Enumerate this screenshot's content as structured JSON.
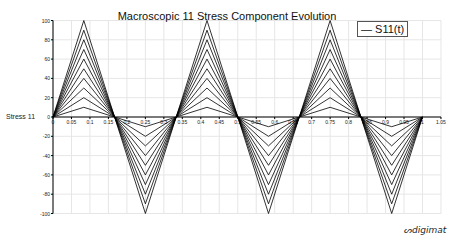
{
  "chart_data": {
    "type": "line",
    "title": "Macroscopic 11 Stress Component Evolution",
    "xlabel": "",
    "ylabel": "Stress 11",
    "xlim": [
      0,
      1.05
    ],
    "ylim": [
      -100,
      100
    ],
    "x_ticks": [
      "0",
      "0.05",
      "0.1",
      "0.15",
      "0.2",
      "0.25",
      "0.3",
      "0.35",
      "0.4",
      "0.45",
      "0.5",
      "0.55",
      "0.6",
      "0.65",
      "0.7",
      "0.75",
      "0.8",
      "0.85",
      "0.9",
      "0.95",
      "1",
      "1.05"
    ],
    "y_ticks": [
      "100",
      "80",
      "60",
      "40",
      "20",
      "0",
      "-20",
      "-40",
      "-60",
      "-80",
      "-100"
    ],
    "grid": true,
    "legend": [
      "S11(t)"
    ],
    "legend_position": "top-right",
    "x": [
      0,
      0.0833,
      0.1667,
      0.25,
      0.3333,
      0.4167,
      0.5,
      0.5833,
      0.6667,
      0.75,
      0.8333,
      0.9167,
      1.0
    ],
    "series": [
      {
        "name": "S11(t) amp 10",
        "values": [
          0,
          10,
          0,
          -10,
          0,
          10,
          0,
          -10,
          0,
          10,
          0,
          -10,
          0
        ]
      },
      {
        "name": "S11(t) amp 20",
        "values": [
          0,
          20,
          0,
          -20,
          0,
          20,
          0,
          -20,
          0,
          20,
          0,
          -20,
          0
        ]
      },
      {
        "name": "S11(t) amp 30",
        "values": [
          0,
          30,
          0,
          -30,
          0,
          30,
          0,
          -30,
          0,
          30,
          0,
          -30,
          0
        ]
      },
      {
        "name": "S11(t) amp 40",
        "values": [
          0,
          40,
          0,
          -40,
          0,
          40,
          0,
          -40,
          0,
          40,
          0,
          -40,
          0
        ]
      },
      {
        "name": "S11(t) amp 50",
        "values": [
          0,
          50,
          0,
          -50,
          0,
          50,
          0,
          -50,
          0,
          50,
          0,
          -50,
          0
        ]
      },
      {
        "name": "S11(t) amp 60",
        "values": [
          0,
          60,
          0,
          -60,
          0,
          60,
          0,
          -60,
          0,
          60,
          0,
          -60,
          0
        ]
      },
      {
        "name": "S11(t) amp 70",
        "values": [
          0,
          70,
          0,
          -70,
          0,
          70,
          0,
          -70,
          0,
          70,
          0,
          -70,
          0
        ]
      },
      {
        "name": "S11(t) amp 80",
        "values": [
          0,
          80,
          0,
          -80,
          0,
          80,
          0,
          -80,
          0,
          80,
          0,
          -80,
          0
        ]
      },
      {
        "name": "S11(t) amp 90",
        "values": [
          0,
          90,
          0,
          -90,
          0,
          90,
          0,
          -90,
          0,
          90,
          0,
          -90,
          0
        ]
      },
      {
        "name": "S11(t) amp 100",
        "values": [
          0,
          100,
          0,
          -100,
          0,
          100,
          0,
          -100,
          0,
          100,
          0,
          -100,
          0
        ]
      }
    ]
  },
  "logo": "digimat",
  "colors": {
    "line": "#000000",
    "grid": "#e6e6e6",
    "axis": "#000000"
  }
}
